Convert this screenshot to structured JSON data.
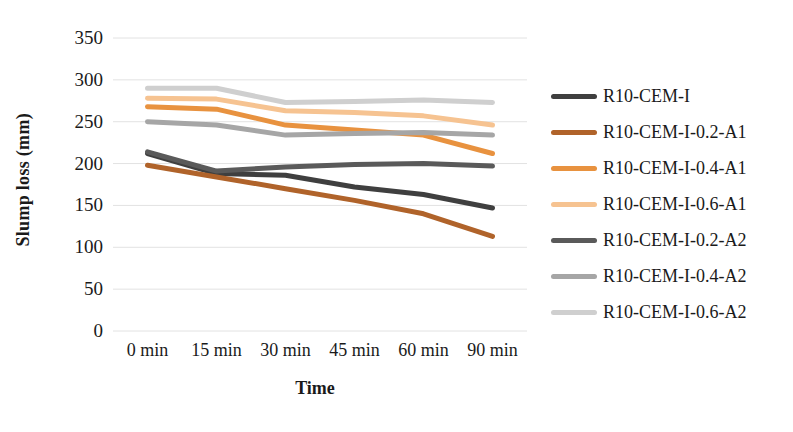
{
  "chart_data": {
    "type": "line",
    "title": "",
    "xlabel": "Time",
    "ylabel": "Slump loss (mm)",
    "categories": [
      "0 min",
      "15 min",
      "30 min",
      "45 min",
      "60 min",
      "90 min"
    ],
    "ylim": [
      0,
      350
    ],
    "yticks": [
      0,
      50,
      100,
      150,
      200,
      250,
      300,
      350
    ],
    "grid": true,
    "legend_position": "right",
    "series": [
      {
        "name": "R10-CEM-I",
        "color": "#3f3f3f",
        "values": [
          212,
          188,
          186,
          172,
          163,
          147
        ]
      },
      {
        "name": "R10-CEM-I-0.2-A1",
        "color": "#b0632a",
        "values": [
          198,
          184,
          170,
          156,
          140,
          113
        ]
      },
      {
        "name": "R10-CEM-I-0.4-A1",
        "color": "#e8923f",
        "values": [
          268,
          265,
          246,
          240,
          234,
          212
        ]
      },
      {
        "name": "R10-CEM-I-0.6-A1",
        "color": "#f6c391",
        "values": [
          278,
          277,
          263,
          261,
          257,
          246
        ]
      },
      {
        "name": "R10-CEM-I-0.2-A2",
        "color": "#5a5a5a",
        "values": [
          214,
          191,
          196,
          199,
          200,
          197
        ]
      },
      {
        "name": "R10-CEM-I-0.4-A2",
        "color": "#a6a6a6",
        "values": [
          250,
          246,
          234,
          236,
          237,
          234
        ]
      },
      {
        "name": "R10-CEM-I-0.6-A2",
        "color": "#cfcfcf",
        "values": [
          290,
          290,
          273,
          274,
          276,
          273
        ]
      }
    ]
  },
  "legend": {
    "items": [
      "R10-CEM-I",
      "R10-CEM-I-0.2-A1",
      "R10-CEM-I-0.4-A1",
      "R10-CEM-I-0.6-A1",
      "R10-CEM-I-0.2-A2",
      "R10-CEM-I-0.4-A2",
      "R10-CEM-I-0.6-A2"
    ]
  }
}
